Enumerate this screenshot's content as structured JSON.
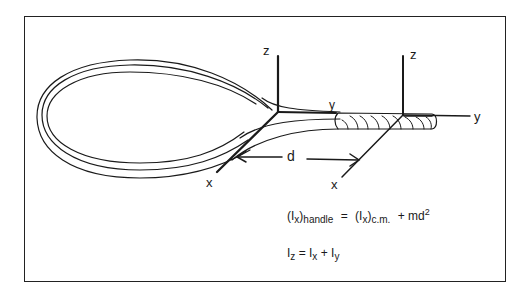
{
  "figure": {
    "axes_cm": {
      "z_label": "z",
      "y_label": "y",
      "x_label": "x"
    },
    "axes_handle": {
      "z_label": "z",
      "y_label": "y",
      "x_label": "x"
    },
    "distance_label": "d"
  },
  "equations": {
    "eq1": {
      "lhs_I": "(I",
      "lhs_sub_x": "x",
      "lhs_close": ")",
      "lhs_sub_handle": "handle",
      "equals": " = ",
      "rhs_I": "(I",
      "rhs_sub_x": "x",
      "rhs_close": ")",
      "rhs_sub_cm": "c.m.",
      "plus": " + md",
      "sup": "2"
    },
    "eq2": {
      "I1": "I",
      "sub_z": "z",
      "eq": " = I",
      "sub_x": "x",
      "plus": " + I",
      "sub_y": "y"
    }
  },
  "colors": {
    "ink": "#1a1a1a",
    "background": "#ffffff"
  }
}
